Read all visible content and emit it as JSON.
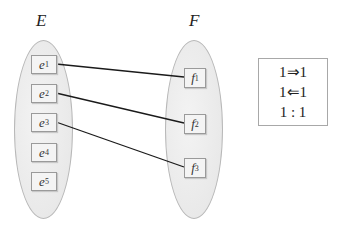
{
  "sets": {
    "E": {
      "label": "E",
      "elements": [
        {
          "base": "e",
          "sub": "1"
        },
        {
          "base": "e",
          "sub": "2"
        },
        {
          "base": "e",
          "sub": "3"
        },
        {
          "base": "e",
          "sub": "4"
        },
        {
          "base": "e",
          "sub": "5"
        }
      ]
    },
    "F": {
      "label": "F",
      "elements": [
        {
          "base": "f",
          "sub": "1"
        },
        {
          "base": "f",
          "sub": "2"
        },
        {
          "base": "f",
          "sub": "3"
        }
      ]
    }
  },
  "mappings": [
    {
      "from": "e1",
      "to": "f1"
    },
    {
      "from": "e2",
      "to": "f2"
    },
    {
      "from": "e3",
      "to": "f3"
    }
  ],
  "legend": {
    "lines": [
      "1⇒1",
      "1⇐1",
      "1 : 1"
    ]
  },
  "colors": {
    "ellipse_fill": "#ebebeb",
    "ellipse_border": "#b8b8b8",
    "node_fill": "#f4f4f4",
    "node_border": "#9a9a9a",
    "link": "#1a1a1a"
  }
}
